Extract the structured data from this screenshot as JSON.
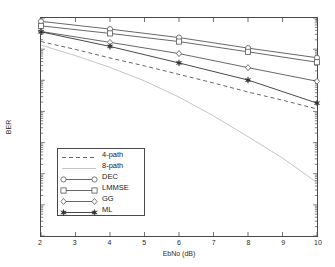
{
  "figure": {
    "background": "#ffffff",
    "axis_color": "#4a4a4a",
    "text_color": "#2b2b2b"
  },
  "axes": {
    "xlabel": "EbNo (dB)",
    "ylabel": "BER",
    "xticks": [
      2,
      3,
      4,
      5,
      6,
      7,
      8,
      9,
      10
    ],
    "xtick_labels": [
      "2",
      "3",
      "4",
      "5",
      "6",
      "7",
      "8",
      "9",
      "10"
    ],
    "ytick_labels": [
      "10",
      "10",
      "10",
      "10",
      "10",
      "10"
    ],
    "ytick_exponents": [
      "-1",
      "-2",
      "-3",
      "-4",
      "-6",
      "-8"
    ],
    "ytick_values": [
      0.1,
      0.01,
      0.001,
      0.0001,
      1e-06,
      1e-08
    ],
    "xlim": [
      2,
      10
    ],
    "ylim": [
      1e-08,
      0.1
    ],
    "yscale": "log",
    "grid": false
  },
  "legend": {
    "position": "lower-left",
    "entries": [
      {
        "label": "4-path",
        "style": "dashed",
        "marker": "none",
        "color": "#555555"
      },
      {
        "label": "8-path",
        "style": "solid",
        "marker": "none",
        "color": "#bdbdbd"
      },
      {
        "label": "DEC",
        "style": "solid",
        "marker": "circle-open",
        "color": "#555555"
      },
      {
        "label": "LMMSE",
        "style": "solid",
        "marker": "square-open",
        "color": "#555555"
      },
      {
        "label": "GG",
        "style": "solid",
        "marker": "diamond-open",
        "color": "#555555"
      },
      {
        "label": "ML",
        "style": "solid",
        "marker": "star-filled",
        "color": "#333333"
      }
    ]
  },
  "chart_data": {
    "type": "line",
    "title": "",
    "xlabel": "EbNo (dB)",
    "ylabel": "BER",
    "xlim": [
      2,
      10
    ],
    "ylim": [
      1e-08,
      0.1
    ],
    "yscale": "log",
    "grid": false,
    "legend_position": "lower-left",
    "x": [
      2,
      4,
      6,
      8,
      10
    ],
    "series": [
      {
        "name": "4-path",
        "style": "dashed",
        "marker": "none",
        "color": "#555555",
        "x": [
          2,
          3,
          4,
          5,
          6,
          7,
          8,
          9,
          10
        ],
        "values": [
          0.0175,
          0.0098,
          0.0052,
          0.0029,
          0.00155,
          0.00082,
          0.00042,
          0.00023,
          0.00012
        ]
      },
      {
        "name": "8-path",
        "style": "solid",
        "marker": "none",
        "color": "#bdbdbd",
        "x": [
          2,
          3,
          4,
          5,
          6,
          7,
          8,
          9,
          10
        ],
        "values": [
          0.0135,
          0.0062,
          0.0026,
          0.00095,
          0.00029,
          7.2e-05,
          1.55e-05,
          3.2e-06,
          5.2e-07
        ]
      },
      {
        "name": "DEC",
        "style": "solid",
        "marker": "circle-open",
        "color": "#555555",
        "x": [
          2,
          4,
          6,
          8,
          10
        ],
        "values": [
          0.078,
          0.044,
          0.0235,
          0.0108,
          0.0053
        ]
      },
      {
        "name": "LMMSE",
        "style": "solid",
        "marker": "square-open",
        "color": "#555555",
        "x": [
          2,
          4,
          6,
          8,
          10
        ],
        "values": [
          0.056,
          0.032,
          0.0175,
          0.0082,
          0.0038
        ]
      },
      {
        "name": "GG",
        "style": "solid",
        "marker": "diamond-open",
        "color": "#555555",
        "x": [
          2,
          4,
          6,
          8,
          10
        ],
        "values": [
          0.037,
          0.0165,
          0.0072,
          0.00255,
          0.00093
        ]
      },
      {
        "name": "ML",
        "style": "solid",
        "marker": "star-filled",
        "color": "#333333",
        "x": [
          2,
          4,
          6,
          8,
          10
        ],
        "values": [
          0.036,
          0.0122,
          0.0036,
          0.00102,
          0.000185
        ]
      }
    ]
  }
}
